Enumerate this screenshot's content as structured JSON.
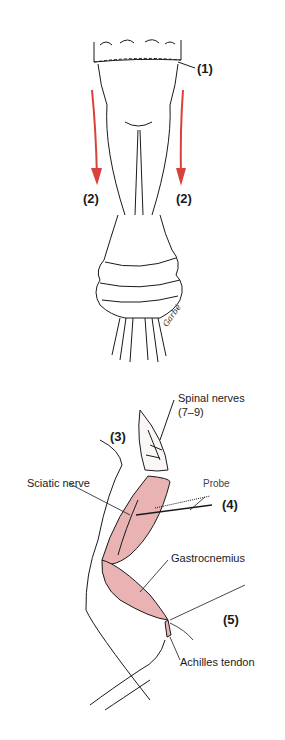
{
  "figure": {
    "colors": {
      "arrow": "#d9413c",
      "muscle": "#e9b3b3",
      "outline": "#1a1a1a"
    },
    "steps": {
      "step1": "(1)",
      "step2_left": "(2)",
      "step2_right": "(2)",
      "step3": "(3)",
      "step4": "(4)",
      "step5": "(5)"
    },
    "labels": {
      "spinal_nerves": "Spinal nerves",
      "spinal_nerves_range": "(7–9)",
      "sciatic_nerve": "Sciatic nerve",
      "probe": "Probe",
      "gastrocnemius": "Gastrocnemius",
      "achilles_tendon": "Achilles tendon"
    },
    "signature": "Garbé"
  }
}
